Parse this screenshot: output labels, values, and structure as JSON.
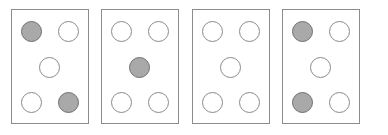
{
  "diagram": {
    "background_color": "#ffffff",
    "card_border_color": "#8c8c8c",
    "card_fill_color": "#ffffff",
    "dot_empty_color": "#ffffff",
    "dot_filled_color": "#a9a9a9",
    "dot_border_color": "#8a8a8a",
    "slot_names": [
      "top-left",
      "top-right",
      "center",
      "bottom-left",
      "bottom-right"
    ],
    "cards": [
      {
        "index": 1,
        "name": "card-1",
        "filled_count": 2,
        "dots": [
          {
            "slot": "top-left",
            "state": "filled"
          },
          {
            "slot": "top-right",
            "state": "empty"
          },
          {
            "slot": "center",
            "state": "empty"
          },
          {
            "slot": "bottom-left",
            "state": "empty"
          },
          {
            "slot": "bottom-right",
            "state": "filled"
          }
        ]
      },
      {
        "index": 2,
        "name": "card-2",
        "filled_count": 1,
        "dots": [
          {
            "slot": "top-left",
            "state": "empty"
          },
          {
            "slot": "top-right",
            "state": "empty"
          },
          {
            "slot": "center",
            "state": "filled"
          },
          {
            "slot": "bottom-left",
            "state": "empty"
          },
          {
            "slot": "bottom-right",
            "state": "empty"
          }
        ]
      },
      {
        "index": 3,
        "name": "card-3",
        "filled_count": 0,
        "dots": [
          {
            "slot": "top-left",
            "state": "empty"
          },
          {
            "slot": "top-right",
            "state": "empty"
          },
          {
            "slot": "center",
            "state": "empty"
          },
          {
            "slot": "bottom-left",
            "state": "empty"
          },
          {
            "slot": "bottom-right",
            "state": "empty"
          }
        ]
      },
      {
        "index": 4,
        "name": "card-4",
        "filled_count": 2,
        "dots": [
          {
            "slot": "top-left",
            "state": "filled"
          },
          {
            "slot": "top-right",
            "state": "empty"
          },
          {
            "slot": "center",
            "state": "empty"
          },
          {
            "slot": "bottom-left",
            "state": "filled"
          },
          {
            "slot": "bottom-right",
            "state": "empty"
          }
        ]
      }
    ]
  }
}
